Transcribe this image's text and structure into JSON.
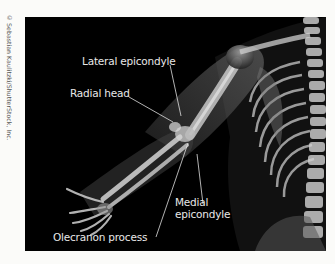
{
  "credit": "© Sebastian Kaulitzki/ShutterStock, Inc.",
  "figure": {
    "background_color": "#000000",
    "bone_color": "#d8d8d8"
  },
  "labels": [
    {
      "id": "lateral-epicondyle",
      "text": "Lateral epicondyle"
    },
    {
      "id": "radial-head",
      "text": "Radial head"
    },
    {
      "id": "medial-epicondyle-line1",
      "text": "Medial"
    },
    {
      "id": "medial-epicondyle-line2",
      "text": "epicondyle"
    },
    {
      "id": "olecranon-process",
      "text": "Olecranon process"
    }
  ]
}
